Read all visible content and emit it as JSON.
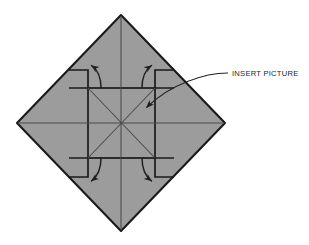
{
  "figure": {
    "type": "instructional-diagram",
    "canvas": {
      "width": 309,
      "height": 245,
      "background": "#ffffff"
    },
    "colors": {
      "paper_fill": "#9c9c9c",
      "paper_outline": "#1a1a1a",
      "crease_line": "#4a4a4a",
      "arrow": "#231f20",
      "leader_line": "#231f20",
      "text": "#231f20"
    },
    "shapes": {
      "diamond": {
        "name": "folded-paper-diamond",
        "center": {
          "x": 121,
          "y": 123
        },
        "vertices": [
          {
            "x": 121,
            "y": 15
          },
          {
            "x": 225,
            "y": 123
          },
          {
            "x": 121,
            "y": 231
          },
          {
            "x": 17,
            "y": 123
          }
        ]
      },
      "inner_square": {
        "name": "center-square-panel",
        "left": 88,
        "top": 88,
        "right": 155,
        "bottom": 158
      },
      "flap_notches": [
        {
          "corner": "top-left",
          "x": 69,
          "y": 70
        },
        {
          "corner": "top-right",
          "x": 174,
          "y": 70
        },
        {
          "corner": "bottom-left",
          "x": 69,
          "y": 177
        },
        {
          "corner": "bottom-right",
          "x": 174,
          "y": 177
        }
      ]
    },
    "creases": [
      {
        "name": "vertical-center-crease",
        "from": {
          "x": 121,
          "y": 15
        },
        "to": {
          "x": 121,
          "y": 231
        }
      },
      {
        "name": "horizontal-center-crease",
        "from": {
          "x": 17,
          "y": 123
        },
        "to": {
          "x": 225,
          "y": 123
        }
      },
      {
        "name": "diagonal-crease-nw-se",
        "from": {
          "x": 88,
          "y": 88
        },
        "to": {
          "x": 155,
          "y": 158
        }
      },
      {
        "name": "diagonal-crease-ne-sw",
        "from": {
          "x": 155,
          "y": 88
        },
        "to": {
          "x": 88,
          "y": 158
        }
      }
    ],
    "arrows": [
      {
        "name": "fold-arrow-top-left",
        "direction": "up-left",
        "tip": {
          "x": 90,
          "y": 64
        }
      },
      {
        "name": "fold-arrow-top-right",
        "direction": "up-right",
        "tip": {
          "x": 153,
          "y": 64
        }
      },
      {
        "name": "fold-arrow-bottom-left",
        "direction": "down-left",
        "tip": {
          "x": 90,
          "y": 183
        }
      },
      {
        "name": "fold-arrow-bottom-right",
        "direction": "down-right",
        "tip": {
          "x": 153,
          "y": 183
        }
      }
    ]
  },
  "annotations": [
    {
      "name": "insert-picture-callout",
      "label": "INSERT PICTURE",
      "text_position": {
        "x": 232,
        "y": 76
      },
      "leader_from": {
        "x": 228,
        "y": 73
      },
      "leader_to": {
        "x": 143,
        "y": 110
      },
      "arrow_tip": {
        "x": 143,
        "y": 110
      }
    }
  ]
}
